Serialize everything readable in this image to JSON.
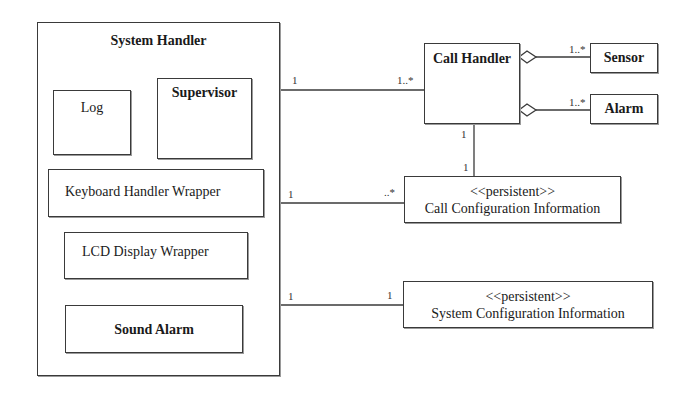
{
  "diagram": {
    "type": "uml-class-diagram",
    "classes": {
      "system_handler": {
        "name": "System Handler"
      },
      "log": {
        "name": "Log"
      },
      "supervisor": {
        "name": "Supervisor"
      },
      "keyboard_handler_wrapper": {
        "name": "Keyboard Handler Wrapper"
      },
      "lcd_display_wrapper": {
        "name": "LCD Display Wrapper"
      },
      "sound_alarm": {
        "name": "Sound Alarm"
      },
      "call_handler": {
        "name": "Call Handler"
      },
      "sensor": {
        "name": "Sensor"
      },
      "alarm": {
        "name": "Alarm"
      },
      "call_configuration_information": {
        "stereotype": "<<persistent>>",
        "name": "Call Configuration Information"
      },
      "system_configuration_information": {
        "stereotype": "<<persistent>>",
        "name": "System Configuration Information"
      }
    },
    "associations": [
      {
        "from": "System Handler",
        "to": "Call Handler",
        "from_mult": "1",
        "to_mult": "1..*",
        "kind": "association"
      },
      {
        "from": "System Handler",
        "to": "Call Configuration Information",
        "from_mult": "1",
        "to_mult": "..*",
        "kind": "association"
      },
      {
        "from": "System Handler",
        "to": "System Configuration Information",
        "from_mult": "1",
        "to_mult": "1",
        "kind": "association"
      },
      {
        "from": "Call Handler",
        "to": "Call Configuration Information",
        "from_mult": "1",
        "to_mult": "1",
        "kind": "association"
      },
      {
        "from": "Call Handler",
        "to": "Sensor",
        "from_mult": "",
        "to_mult": "1..*",
        "kind": "aggregation"
      },
      {
        "from": "Call Handler",
        "to": "Alarm",
        "from_mult": "",
        "to_mult": "1..*",
        "kind": "aggregation"
      }
    ]
  }
}
